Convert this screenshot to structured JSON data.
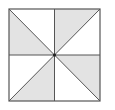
{
  "diagram": {
    "type": "pinwheel-square",
    "colors": {
      "stroke": "#555555",
      "shade": "#e3e3e3",
      "background": "#ffffff"
    },
    "square": {
      "x": 9,
      "y": 9,
      "w": 91,
      "h": 92
    },
    "shaded_triangles": [
      {
        "points": "9,9 9,55 54.5,55"
      },
      {
        "points": "54.5,9 100,9 54.5,55"
      },
      {
        "points": "100,55 100,101 54.5,55"
      },
      {
        "points": "9,101 54.5,101 54.5,55"
      }
    ]
  }
}
